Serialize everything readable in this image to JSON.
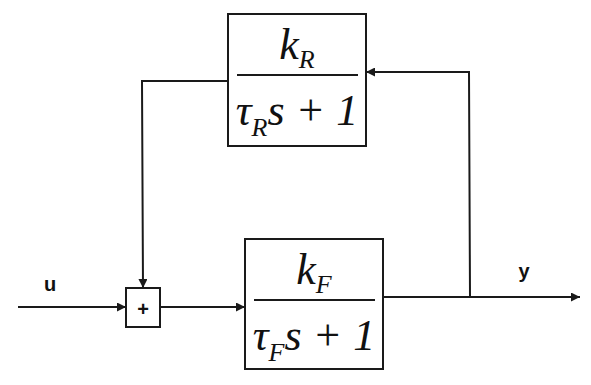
{
  "diagram": {
    "type": "feedback block diagram",
    "signals": {
      "input": "u",
      "output": "y"
    },
    "summing_junction": {
      "symbol": "+"
    },
    "forward_block": {
      "numerator": "k",
      "numerator_sub": "F",
      "denominator_tau": "τ",
      "denominator_sub": "F",
      "denominator_rest": "s + 1"
    },
    "feedback_block": {
      "numerator": "k",
      "numerator_sub": "R",
      "denominator_tau": "τ",
      "denominator_sub": "R",
      "denominator_rest": "s + 1"
    },
    "colors": {
      "line": "#1a1a1a",
      "background": "#ffffff"
    }
  }
}
